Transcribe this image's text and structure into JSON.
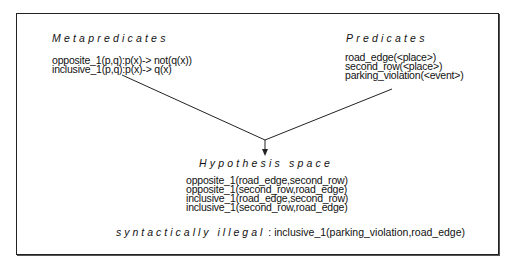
{
  "metapredicates": {
    "title": "Metapredicates",
    "items": [
      "opposite_1(p,q):p(x)-> not(q(x))",
      "inclusive_1(p,q):p(x)-> q(x)"
    ]
  },
  "predicates": {
    "title": "Predicates",
    "items": [
      "road_edge(<place>)",
      "second_row(<place>)",
      "parking_violation(<event>)"
    ]
  },
  "hypothesis_space": {
    "title": "Hypothesis space",
    "items": [
      "opposite_1(road_edge,second_row)",
      "opposite_1(second_row,road_edge)",
      "inclusive_1(road_edge,second_row)",
      "inclusive_1(second_row,road_edge)"
    ]
  },
  "illegal": {
    "label": "syntactically illegal",
    "separator": " : ",
    "example": "inclusive_1(parking_violation,road_edge)"
  },
  "colors": {
    "ink": "#111111",
    "background": "#ffffff"
  }
}
